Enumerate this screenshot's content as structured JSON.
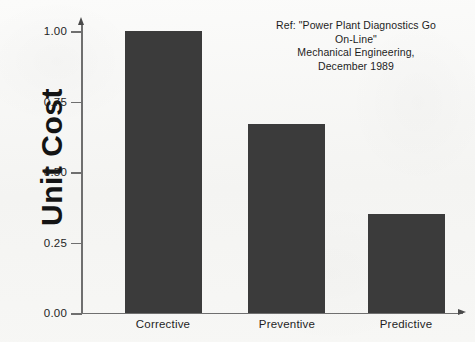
{
  "chart_data": {
    "type": "bar",
    "title": "",
    "xlabel": "",
    "ylabel": "Unit Cost",
    "categories": [
      "Corrective",
      "Preventive",
      "Predictive"
    ],
    "values": [
      1.0,
      0.67,
      0.35
    ],
    "ylim": [
      0.0,
      1.0
    ],
    "ytick_labels": [
      "1.00",
      "0.75",
      "0.50",
      "0.25",
      "0.00"
    ],
    "ytick_values": [
      1.0,
      0.75,
      0.5,
      0.25,
      0.0
    ],
    "grid": false,
    "legend": "none",
    "bar_color": "#3b3b3b",
    "background_color": "#f6f6f4",
    "axis_color": "#6f6f6f",
    "annotations": [
      "Ref: \"Power Plant Diagnostics Go",
      "On-Line\"",
      "Mechanical Engineering,",
      "December 1989"
    ]
  }
}
